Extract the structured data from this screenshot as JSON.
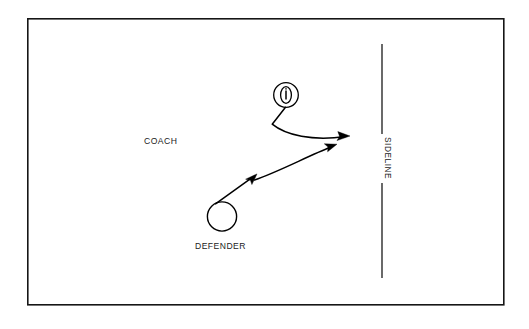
{
  "diagram": {
    "background_color": "#ffffff",
    "ink_color": "#000000",
    "frame": {
      "name": "field-boundary",
      "x": 27,
      "y": 18,
      "width": 477,
      "height": 287
    },
    "labels": {
      "coach": "COACH",
      "defender": "DEFENDER",
      "sideline": "SIDELINE"
    },
    "markers": {
      "coach_icon": "football-in-circle-icon",
      "defender_icon": "open-circle-icon",
      "sideline_icon": "vertical-line-icon"
    },
    "elements": [
      {
        "name": "coach-marker",
        "kind": "circle-with-football",
        "cx": 286,
        "cy": 95,
        "r": 12.5
      },
      {
        "name": "defender-marker",
        "kind": "open-circle",
        "cx": 222,
        "cy": 216,
        "r": 15
      },
      {
        "name": "sideline",
        "kind": "vertical-line",
        "x": 382,
        "y_top": 44,
        "y_bottom": 278,
        "gap_top": 134,
        "gap_bottom": 183
      }
    ],
    "routes": [
      {
        "name": "coach-route",
        "from": "coach-marker",
        "to": "sideline",
        "arrowheads": 1,
        "description": "ball path curving down-left then right to the sideline"
      },
      {
        "name": "defender-route",
        "from": "defender-marker",
        "to": "sideline",
        "arrowheads": 2,
        "description": "defender pursues up and to the right toward the sideline"
      }
    ]
  }
}
